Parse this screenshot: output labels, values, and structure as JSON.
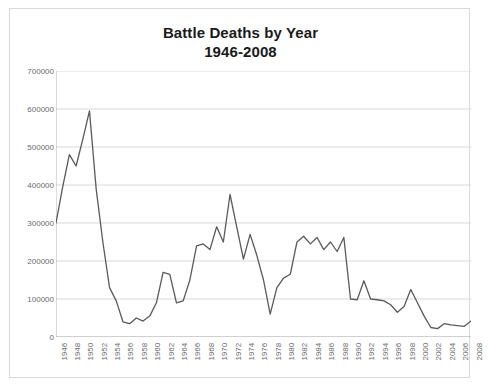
{
  "chart_data": {
    "type": "line",
    "title": "Battle Deaths by Year",
    "subtitle": "1946-2008",
    "xlabel": "",
    "ylabel": "",
    "grid": true,
    "legend": false,
    "xlim": [
      1946,
      2008
    ],
    "ylim": [
      0,
      700000
    ],
    "ytick_step": 100000,
    "xtick_step": 2,
    "series_color": "#58595b",
    "grid_color": "#d9d9d9",
    "axis_label_color": "#6b6b6b",
    "ytick_labels": [
      "700000",
      "600000",
      "500000",
      "400000",
      "300000",
      "200000",
      "100000",
      "0"
    ],
    "ytick_values": [
      700000,
      600000,
      500000,
      400000,
      300000,
      200000,
      100000,
      0
    ],
    "xtick_labels": [
      "1946",
      "1948",
      "1950",
      "1952",
      "1954",
      "1956",
      "1958",
      "1960",
      "1962",
      "1964",
      "1966",
      "1968",
      "1970",
      "1972",
      "1974",
      "1976",
      "1978",
      "1980",
      "1982",
      "1984",
      "1986",
      "1988",
      "1990",
      "1992",
      "1994",
      "1996",
      "1998",
      "2000",
      "2002",
      "2004",
      "2006",
      "2008"
    ],
    "x": [
      1946,
      1947,
      1948,
      1949,
      1950,
      1951,
      1952,
      1953,
      1954,
      1955,
      1956,
      1957,
      1958,
      1959,
      1960,
      1961,
      1962,
      1963,
      1964,
      1965,
      1966,
      1967,
      1968,
      1969,
      1970,
      1971,
      1972,
      1973,
      1974,
      1975,
      1976,
      1977,
      1978,
      1979,
      1980,
      1981,
      1982,
      1983,
      1984,
      1985,
      1986,
      1987,
      1988,
      1989,
      1990,
      1991,
      1992,
      1993,
      1994,
      1995,
      1996,
      1997,
      1998,
      1999,
      2000,
      2001,
      2002,
      2003,
      2004,
      2005,
      2006,
      2007,
      2008
    ],
    "values": [
      300000,
      395000,
      480000,
      450000,
      520000,
      595000,
      390000,
      250000,
      130000,
      95000,
      40000,
      35000,
      50000,
      42000,
      55000,
      90000,
      170000,
      165000,
      90000,
      95000,
      150000,
      240000,
      245000,
      230000,
      290000,
      250000,
      375000,
      290000,
      205000,
      270000,
      215000,
      150000,
      60000,
      130000,
      155000,
      165000,
      250000,
      265000,
      245000,
      262000,
      230000,
      250000,
      225000,
      262000,
      100000,
      98000,
      148000,
      100000,
      98000,
      95000,
      85000,
      65000,
      80000,
      125000,
      90000,
      55000,
      25000,
      22000,
      35000,
      32000,
      30000,
      28000,
      42000
    ]
  },
  "meta": {
    "series_name": "Battle Deaths"
  }
}
